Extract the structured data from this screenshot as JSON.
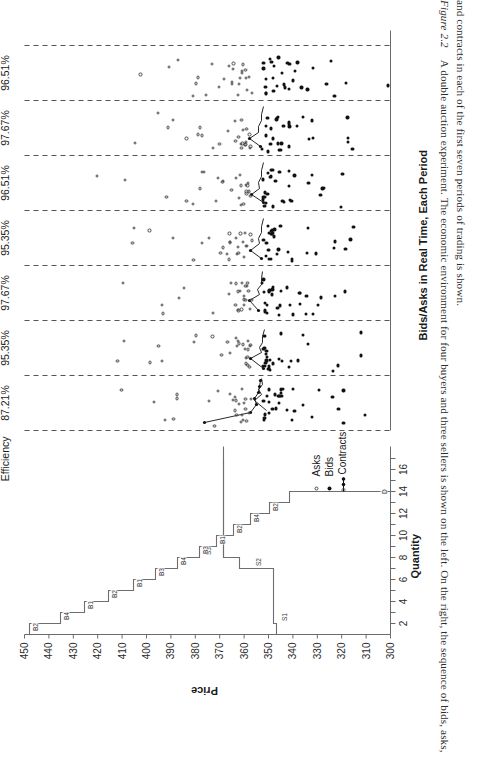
{
  "figure": {
    "caption_label": "Figure 2.2",
    "caption_line1": "A double auction experiment. The economic environment for four buyers and three sellers is shown on the left. On the right, the sequence of bids, asks,",
    "caption_line2": "and contracts in each of the first seven periods of trading is shown."
  },
  "supply_demand": {
    "y_axis_label": "Price",
    "x_axis_label": "Quantity",
    "y_ticks": [
      450,
      440,
      430,
      420,
      410,
      400,
      390,
      380,
      370,
      360,
      350,
      340,
      330,
      320,
      310,
      300
    ],
    "x_ticks": [
      2,
      4,
      6,
      8,
      10,
      12,
      14,
      16
    ],
    "demand_marker": "D",
    "step_labels": [
      "B2",
      "B4",
      "B1",
      "B2",
      "B1",
      "B3",
      "S3",
      "B4",
      "S2",
      "B3",
      "B1",
      "B2",
      "B4",
      "B2",
      "S1",
      "D"
    ]
  },
  "bids_asks": {
    "title": "Bids/Asks in Real Time, Each Period",
    "period_header": "Period",
    "efficiency_header": "Efficiency",
    "periods": [
      {
        "num": "1",
        "efficiency": "87.21%"
      },
      {
        "num": "2",
        "efficiency": "95.35%"
      },
      {
        "num": "3",
        "efficiency": "97.67%"
      },
      {
        "num": "4",
        "efficiency": "95.35%"
      },
      {
        "num": "5",
        "efficiency": "96.51%"
      },
      {
        "num": "6",
        "efficiency": "97.67%"
      },
      {
        "num": "7",
        "efficiency": "96.51%"
      }
    ],
    "legend": [
      {
        "label": "Asks",
        "marker": "open-circle"
      },
      {
        "label": "Bids",
        "marker": "filled-dot"
      },
      {
        "label": "Contracts",
        "marker": "line-with-markers"
      }
    ]
  },
  "chart_data": {
    "type": "scatter",
    "title": "Bids/Asks in Real Time, Each Period",
    "xlabel": "Quantity",
    "ylabel": "Price",
    "ylim": [
      300,
      450
    ],
    "grid": false,
    "legend_position": "inside-lower-left",
    "panels": [
      {
        "name": "supply-demand",
        "type": "step",
        "xlabel": "Quantity",
        "ylabel": "Price",
        "xlim": [
          0,
          17
        ],
        "ylim": [
          300,
          455
        ],
        "demand_steps": [
          {
            "q": 1,
            "p": 448,
            "agent": "B2"
          },
          {
            "q": 2,
            "p": 435,
            "agent": "B2"
          },
          {
            "q": 3,
            "p": 425,
            "agent": "B4"
          },
          {
            "q": 4,
            "p": 415,
            "agent": "B3"
          },
          {
            "q": 5,
            "p": 405,
            "agent": "B1"
          },
          {
            "q": 6,
            "p": 396,
            "agent": "B1"
          },
          {
            "q": 7,
            "p": 387,
            "agent": "B3"
          },
          {
            "q": 8,
            "p": 378,
            "agent": "B2"
          },
          {
            "q": 9,
            "p": 369,
            "agent": "B4"
          },
          {
            "q": 10,
            "p": 362,
            "agent": "B1"
          },
          {
            "q": 11,
            "p": 355,
            "agent": "B3"
          },
          {
            "q": 12,
            "p": 348,
            "agent": "B2"
          },
          {
            "q": 13,
            "p": 340,
            "agent": "B4"
          },
          {
            "q": 14,
            "p": 332,
            "agent": "B2"
          },
          {
            "q": 15,
            "p": 300,
            "agent": "D"
          }
        ],
        "supply_steps": [
          {
            "q": 1,
            "p": 345,
            "agent": "S1"
          },
          {
            "q": 7,
            "p": 352,
            "agent": "S2"
          },
          {
            "q": 9,
            "p": 366,
            "agent": "S3"
          },
          {
            "q": 16,
            "p": 366,
            "agent": "S3"
          }
        ]
      },
      {
        "name": "bids-asks-by-period",
        "type": "scatter",
        "series": [
          {
            "name": "Asks",
            "marker": "open-circle"
          },
          {
            "name": "Bids",
            "marker": "filled-dot"
          },
          {
            "name": "Contracts",
            "marker": "line"
          }
        ],
        "period_efficiencies": [
          87.21,
          95.35,
          97.67,
          95.35,
          96.51,
          97.67,
          96.51
        ]
      }
    ]
  }
}
